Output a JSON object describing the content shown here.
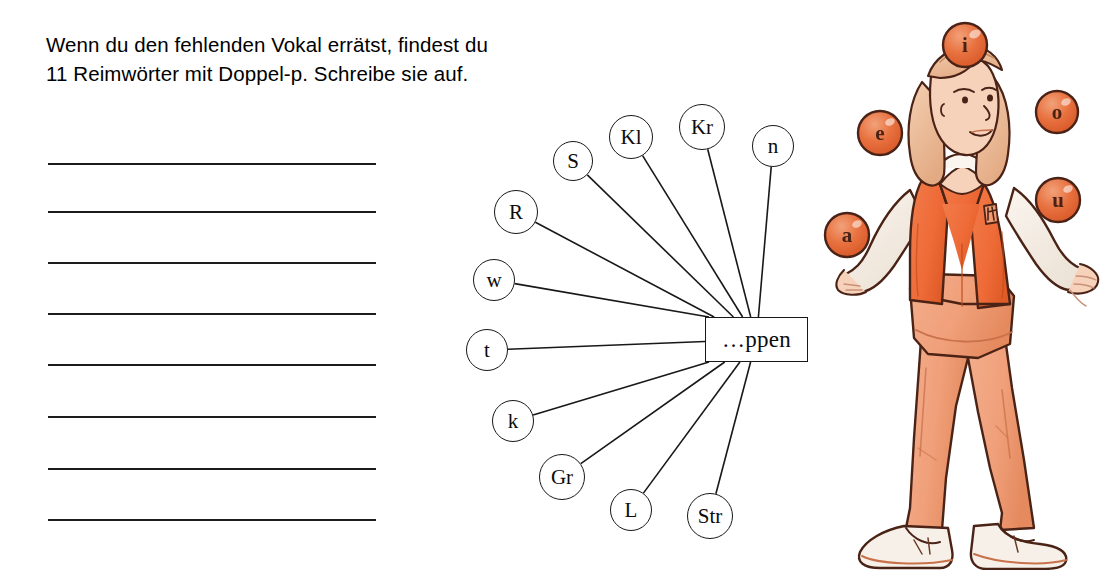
{
  "instruction": {
    "line1": "Wenn du den fehlenden Vokal errätst, findest du",
    "line2": "11 Reimwörter mit Doppel-p. Schreibe sie auf."
  },
  "answer_lines": {
    "count": 8,
    "positions_y": [
      163,
      211,
      262,
      313,
      364,
      416,
      468,
      519
    ]
  },
  "word_web": {
    "center_label": "…ppen",
    "nodes": [
      {
        "label": "S",
        "cx": 133,
        "cy": 71,
        "r": 20
      },
      {
        "label": "Kl",
        "cx": 191,
        "cy": 47,
        "r": 22
      },
      {
        "label": "Kr",
        "cx": 262,
        "cy": 37,
        "r": 23
      },
      {
        "label": "n",
        "cx": 333,
        "cy": 56,
        "r": 21
      },
      {
        "label": "R",
        "cx": 76,
        "cy": 122,
        "r": 22
      },
      {
        "label": "w",
        "cx": 54,
        "cy": 190,
        "r": 21
      },
      {
        "label": "t",
        "cx": 47,
        "cy": 260,
        "r": 21
      },
      {
        "label": "k",
        "cx": 73,
        "cy": 331,
        "r": 21
      },
      {
        "label": "Gr",
        "cx": 122,
        "cy": 387,
        "r": 23
      },
      {
        "label": "L",
        "cx": 191,
        "cy": 420,
        "r": 21
      },
      {
        "label": "Str",
        "cx": 270,
        "cy": 426,
        "r": 23
      }
    ],
    "center_box": {
      "x": 265,
      "y": 227,
      "w": 103,
      "h": 45
    }
  },
  "juggler": {
    "alt": "Girl in orange vest juggling five lettered balls",
    "balls": [
      {
        "letter": "i",
        "cx": 147,
        "cy": 37,
        "r": 22
      },
      {
        "letter": "o",
        "cx": 239,
        "cy": 104,
        "r": 21
      },
      {
        "letter": "e",
        "cx": 62,
        "cy": 125,
        "r": 22
      },
      {
        "letter": "u",
        "cx": 240,
        "cy": 192,
        "r": 22
      },
      {
        "letter": "a",
        "cx": 29,
        "cy": 227,
        "r": 22
      }
    ]
  },
  "colors": {
    "ball_fill": "#e8713f",
    "ball_fill_light": "#f29a70",
    "vest": "#ef6b38",
    "vest_shadow": "#d7521f",
    "pants": "#f0a07a",
    "pants_shadow": "#e08356",
    "skin": "#f6d2bb",
    "hair": "#efc1a0",
    "shirt": "#f2ece5",
    "shoe": "#f6f0e8",
    "ink": "#4a2316",
    "line": "#1c1c1c",
    "text": "#000000"
  }
}
